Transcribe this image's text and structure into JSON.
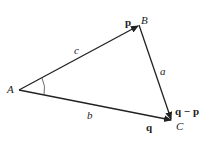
{
  "diagram": {
    "type": "vector-triangle",
    "vertices": {
      "A": {
        "label": "A",
        "x": 19,
        "y": 90
      },
      "B": {
        "label": "B",
        "x": 139,
        "y": 25
      },
      "C": {
        "label": "C",
        "x": 172,
        "y": 120
      }
    },
    "sides": {
      "c": {
        "label": "c",
        "from": "A",
        "to": "B",
        "vector": "p"
      },
      "a": {
        "label": "a",
        "from": "B",
        "to": "C",
        "vector": "q − p"
      },
      "b": {
        "label": "b",
        "from": "A",
        "to": "C",
        "vector": "q"
      }
    },
    "vectors": {
      "p": "p",
      "q": "q",
      "q_minus_p": "q − p"
    },
    "angle_marker_at": "A",
    "stroke_color": "#222222"
  }
}
